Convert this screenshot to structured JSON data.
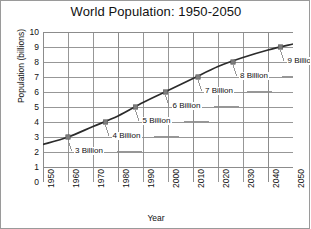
{
  "chart_data": {
    "type": "line",
    "title": "World Population: 1950-2050",
    "xlabel": "Year",
    "ylabel": "Population (billions)",
    "xlim": [
      1950,
      2050
    ],
    "ylim": [
      0,
      10
    ],
    "grid": true,
    "legend": "none",
    "xticks": [
      "1950",
      "1960",
      "1970",
      "1980",
      "1990",
      "2000",
      "2010",
      "2020",
      "2030",
      "2040",
      "2050"
    ],
    "yticks": [
      "0",
      "1",
      "2",
      "3",
      "4",
      "5",
      "6",
      "7",
      "8",
      "9",
      "10"
    ],
    "x": [
      1950,
      1960,
      1970,
      1980,
      1990,
      2000,
      2010,
      2020,
      2030,
      2040,
      2050
    ],
    "values": [
      2.5,
      3.0,
      3.7,
      4.4,
      5.3,
      6.1,
      6.9,
      7.7,
      8.3,
      8.8,
      9.2
    ],
    "annotations": [
      {
        "label": "3 Billion",
        "x": 1960,
        "y": 3
      },
      {
        "label": "4 Billion",
        "x": 1975,
        "y": 4
      },
      {
        "label": "5 Billion",
        "x": 1987,
        "y": 5
      },
      {
        "label": "6 Billion",
        "x": 1999,
        "y": 6
      },
      {
        "label": "7 Billion",
        "x": 2012,
        "y": 7
      },
      {
        "label": "8 Billion",
        "x": 2026,
        "y": 8
      },
      {
        "label": "9 Billion",
        "x": 2045,
        "y": 9
      }
    ],
    "colors": {
      "line": "#2b2b2b",
      "marker": "#7d7d7d",
      "grid": "#8c8c8c",
      "axis": "#3a3a3a"
    }
  }
}
